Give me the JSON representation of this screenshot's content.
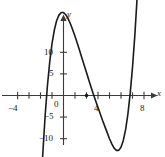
{
  "figure": {
    "background_color": "#ffffff",
    "curve_color": "#1a1a1a",
    "axis_color": "#3a3a3a"
  },
  "axes": {
    "x_axis_name": "x",
    "y_axis_name": "y"
  },
  "labels": {
    "x": {
      "neg4": "−4",
      "zero": "0",
      "four": "4",
      "eight": "8"
    },
    "y": {
      "ten": "10",
      "five": "5",
      "neg5": "−5",
      "neg10": "−10"
    }
  },
  "chart_data": {
    "type": "line",
    "title": "",
    "xlabel": "x",
    "ylabel": "y",
    "grid": false,
    "legend": null,
    "xlim": [
      -5,
      9
    ],
    "ylim": [
      -16,
      20
    ],
    "xticks": [
      -4,
      -3,
      -2,
      -1,
      0,
      1,
      2,
      3,
      4,
      5,
      6,
      7,
      8
    ],
    "xtick_labels": [
      "−4",
      "",
      "",
      "",
      "0",
      "",
      "",
      "",
      "4",
      "",
      "",
      "",
      "8"
    ],
    "yticks": [
      -10,
      -5,
      0,
      5,
      10
    ],
    "ytick_labels": [
      "−10",
      "−5",
      "0",
      "5",
      "10"
    ],
    "annotations": [
      {
        "label": "point",
        "x": 2,
        "y": 0
      }
    ],
    "series": [
      {
        "name": "cubic",
        "x": [
          -2.2,
          -2.0,
          -1.8,
          -1.6,
          -1.4,
          -1.2,
          -1.0,
          -0.8,
          -0.6,
          -0.4,
          -0.2,
          0.0,
          0.2,
          0.4,
          0.6,
          0.8,
          1.0,
          1.2,
          1.4,
          1.6,
          1.8,
          2.0,
          2.2,
          2.4,
          2.6,
          2.8,
          3.0,
          3.2,
          3.4,
          3.6,
          3.8,
          4.0,
          4.2,
          4.4,
          4.6,
          4.8,
          5.0,
          5.2,
          5.4,
          5.6,
          5.8,
          6.0,
          6.2,
          6.4,
          6.6,
          6.8,
          7.0
        ],
        "y": [
          -36.5,
          -24.0,
          -13.5,
          -4.8,
          2.2,
          7.7,
          12.0,
          15.1,
          17.3,
          18.6,
          19.2,
          19.2,
          18.7,
          17.8,
          16.6,
          15.2,
          13.7,
          12.1,
          10.4,
          8.7,
          7.0,
          5.3,
          3.6,
          1.9,
          0.3,
          -1.3,
          -2.8,
          -4.3,
          -5.8,
          -7.2,
          -8.6,
          -10.0,
          -11.2,
          -12.2,
          -12.7,
          -12.7,
          -12.0,
          -10.4,
          -7.9,
          -4.3,
          0.5,
          6.5,
          13.8,
          22.6,
          32.9,
          44.9,
          58.6
        ]
      }
    ]
  }
}
